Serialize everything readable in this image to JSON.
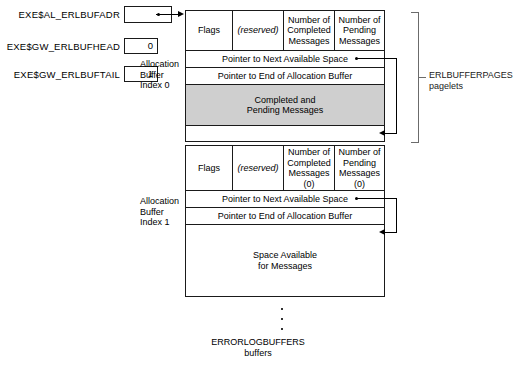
{
  "variables": [
    {
      "name": "EXE$AL_ERLBUFADR",
      "kind": "pointer",
      "value": ""
    },
    {
      "name": "EXE$GW_ERLBUFHEAD",
      "kind": "value",
      "value": "0"
    },
    {
      "name": "EXE$GW_ERLBUFTAIL",
      "kind": "value",
      "value": "1"
    }
  ],
  "allocation_captions": [
    {
      "line1": "Allocation",
      "line2": "Buffer",
      "line3": "Index 0"
    },
    {
      "line1": "Allocation",
      "line2": "Buffer",
      "line3": "Index 1"
    }
  ],
  "block0": {
    "header": {
      "flags": "Flags",
      "reserved": "(reserved)",
      "completed": "Number of\nCompleted\nMessages",
      "completed_l1": "Number of",
      "completed_l2": "Completed",
      "completed_l3": "Messages",
      "pending_l1": "Number of",
      "pending_l2": "Pending",
      "pending_l3": "Messages"
    },
    "row_next_ptr": "Pointer to Next Available Space",
    "row_end_ptr": "Pointer to End of Allocation Buffer",
    "body_l1": "Completed and",
    "body_l2": "Pending Messages"
  },
  "block1": {
    "header": {
      "flags": "Flags",
      "reserved": "(reserved)",
      "completed_l1": "Number of",
      "completed_l2": "Completed",
      "completed_l3": "Messages",
      "completed_l4": "(0)",
      "pending_l1": "Number of",
      "pending_l2": "Pending",
      "pending_l3": "Messages",
      "pending_l4": "(0)"
    },
    "row_next_ptr": "Pointer to Next Available Space",
    "row_end_ptr": "Pointer to End of Allocation Buffer",
    "body_l1": "Space Available",
    "body_l2": "for Messages"
  },
  "bracket": {
    "line1": "ERLBUFFERPAGES",
    "line2": "pagelets"
  },
  "bottom": {
    "line1": "ERRORLOGBUFFERS",
    "line2": "buffers"
  },
  "colors": {
    "shaded_fill": "#cfcfcf",
    "stroke": "#1a1a1a",
    "bracket_stroke": "#6b6b6b"
  }
}
